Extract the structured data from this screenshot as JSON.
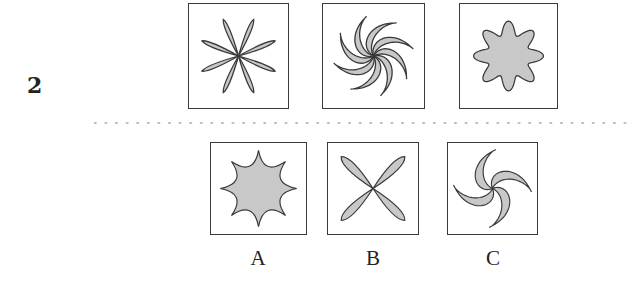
{
  "question": {
    "number": "2",
    "sequence": [
      {
        "id": "q1",
        "figure": "eight-petal-thin-flower"
      },
      {
        "id": "q2",
        "figure": "eight-arm-swirl"
      },
      {
        "id": "q3",
        "figure": "eight-lobe-rounded-blob"
      }
    ]
  },
  "options": [
    {
      "label": "A",
      "figure": "eight-point-concave-star"
    },
    {
      "label": "B",
      "figure": "four-petal-x-flower"
    },
    {
      "label": "C",
      "figure": "four-arm-swirl"
    }
  ],
  "colors": {
    "fill": "#c8c8c8",
    "stroke": "#3a3a3a",
    "divider": "#b5b5b5"
  }
}
